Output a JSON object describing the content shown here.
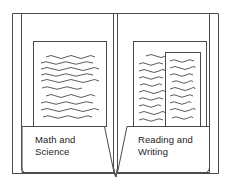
{
  "figure": {
    "kind": "line-drawing",
    "background_color": "#ffffff",
    "stroke_color": "#4a4a4a",
    "paper_fill": "#ffffff",
    "text_color": "#232323"
  },
  "folder": {
    "outer_frame": {
      "name": "folder-outer-edge",
      "points": "12,13 219,13 219,174 12,174"
    },
    "left_cover": {
      "name": "left-cover-inner-fold",
      "inner_edge_x": 21,
      "bottom_curl_y": 170
    },
    "right_cover": {
      "name": "right-cover-inner-fold",
      "inner_edge_x": 210,
      "bottom_curl_y": 170
    },
    "spine": {
      "name": "center-spine",
      "left_line_x": 113,
      "right_line_x": 118,
      "converge_y": 176
    }
  },
  "pockets": [
    {
      "id": "left",
      "name": "left-pocket",
      "label": "Math and\nScience",
      "top_y": 126,
      "left_x": 22,
      "right_x": 104,
      "diagonal_to_x": 113,
      "bottom_y": 172,
      "papers": [
        {
          "name": "left-paper-back",
          "x": 33,
          "y": 41,
          "w": 74,
          "h": 85,
          "lines": 10
        }
      ]
    },
    {
      "id": "right",
      "name": "right-pocket",
      "label": "Reading and\nWriting",
      "top_y": 126,
      "left_x": 127,
      "right_x": 209,
      "diagonal_to_x": 118,
      "bottom_y": 172,
      "papers": [
        {
          "name": "right-paper-back",
          "x": 133,
          "y": 41,
          "w": 74,
          "h": 85,
          "lines": 11
        },
        {
          "name": "right-paper-front",
          "x": 165,
          "y": 52,
          "w": 36,
          "h": 74,
          "lines": 9
        }
      ]
    }
  ],
  "labels": {
    "left_pocket_label": "Math and\nScience",
    "right_pocket_label": "Reading and\nWriting"
  },
  "squiggle_description": "hand-drawn wavy horizontal lines representing lines of writing on each sheet of paper"
}
